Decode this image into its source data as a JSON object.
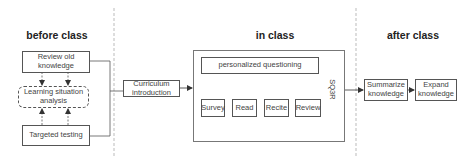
{
  "sections": {
    "before": {
      "title": "before class",
      "review": "Review old knowledge",
      "analysis": "Learning situation analysis",
      "testing": "Targeted testing"
    },
    "transition": {
      "curriculum": "Curriculum introduction"
    },
    "in": {
      "title": "in class",
      "questioning": "personalized questioning",
      "steps": [
        "Survey",
        "Read",
        "Recite",
        "Review"
      ],
      "method_label": "SQ3R"
    },
    "after": {
      "title": "after class",
      "summarize": "Summarize knowledge",
      "expand": "Expand knowledge"
    }
  },
  "colors": {
    "line": "#555555",
    "divider": "#bbbbbb",
    "text": "#444444",
    "title": "#222222"
  }
}
